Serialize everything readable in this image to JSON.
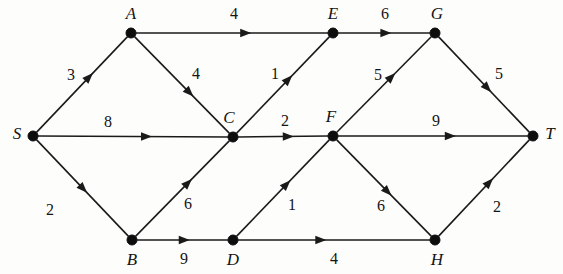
{
  "diagram": {
    "type": "directed-weighted-graph",
    "width": 563,
    "height": 274,
    "background_color": "#fdfdfb",
    "stroke_color": "#1a1a1a",
    "node_color": "#0d0d0d",
    "text_color": "#141414"
  },
  "nodes": [
    {
      "id": "S",
      "label": "S",
      "x": 33,
      "y": 136,
      "label_x": 17,
      "label_y": 134
    },
    {
      "id": "A",
      "label": "A",
      "x": 131,
      "y": 33,
      "label_x": 131,
      "label_y": 14
    },
    {
      "id": "B",
      "label": "B",
      "x": 132,
      "y": 240,
      "label_x": 132,
      "label_y": 260
    },
    {
      "id": "C",
      "label": "C",
      "x": 233,
      "y": 137,
      "label_x": 229,
      "label_y": 118
    },
    {
      "id": "D",
      "label": "D",
      "x": 233,
      "y": 240,
      "label_x": 233,
      "label_y": 260
    },
    {
      "id": "E",
      "label": "E",
      "x": 333,
      "y": 33,
      "label_x": 333,
      "label_y": 14
    },
    {
      "id": "F",
      "label": "F",
      "x": 333,
      "y": 136,
      "label_x": 331,
      "label_y": 117
    },
    {
      "id": "G",
      "label": "G",
      "x": 435,
      "y": 33,
      "label_x": 437,
      "label_y": 14
    },
    {
      "id": "H",
      "label": "H",
      "x": 435,
      "y": 240,
      "label_x": 437,
      "label_y": 260
    },
    {
      "id": "T",
      "label": "T",
      "x": 533,
      "y": 136,
      "label_x": 550,
      "label_y": 134
    }
  ],
  "edges": [
    {
      "from": "S",
      "to": "A",
      "weight": "3",
      "label_x": 71,
      "label_y": 75,
      "arrow_t": 0.62
    },
    {
      "from": "S",
      "to": "C",
      "weight": "8",
      "label_x": 108,
      "label_y": 122,
      "arrow_t": 0.6
    },
    {
      "from": "S",
      "to": "B",
      "weight": "2",
      "label_x": 50,
      "label_y": 210,
      "arrow_t": 0.55
    },
    {
      "from": "A",
      "to": "E",
      "weight": "4",
      "label_x": 234,
      "label_y": 14,
      "arrow_t": 0.6
    },
    {
      "from": "A",
      "to": "C",
      "weight": "4",
      "label_x": 196,
      "label_y": 74,
      "arrow_t": 0.62
    },
    {
      "from": "B",
      "to": "C",
      "weight": "6",
      "label_x": 188,
      "label_y": 204,
      "arrow_t": 0.6
    },
    {
      "from": "B",
      "to": "D",
      "weight": "9",
      "label_x": 184,
      "label_y": 259,
      "arrow_t": 0.58
    },
    {
      "from": "C",
      "to": "E",
      "weight": "1",
      "label_x": 275,
      "label_y": 74,
      "arrow_t": 0.6
    },
    {
      "from": "C",
      "to": "F",
      "weight": "2",
      "label_x": 285,
      "label_y": 121,
      "arrow_t": 0.62
    },
    {
      "from": "D",
      "to": "F",
      "weight": "1",
      "label_x": 292,
      "label_y": 205,
      "arrow_t": 0.58
    },
    {
      "from": "D",
      "to": "H",
      "weight": "4",
      "label_x": 334,
      "label_y": 259,
      "arrow_t": 0.46
    },
    {
      "from": "E",
      "to": "G",
      "weight": "6",
      "label_x": 385,
      "label_y": 14,
      "arrow_t": 0.58
    },
    {
      "from": "F",
      "to": "G",
      "weight": "5",
      "label_x": 378,
      "label_y": 75,
      "arrow_t": 0.62
    },
    {
      "from": "F",
      "to": "T",
      "weight": "9",
      "label_x": 436,
      "label_y": 121,
      "arrow_t": 0.62
    },
    {
      "from": "F",
      "to": "H",
      "weight": "6",
      "label_x": 381,
      "label_y": 206,
      "arrow_t": 0.58
    },
    {
      "from": "G",
      "to": "T",
      "weight": "5",
      "label_x": 499,
      "label_y": 74,
      "arrow_t": 0.58
    },
    {
      "from": "H",
      "to": "T",
      "weight": "2",
      "label_x": 497,
      "label_y": 207,
      "arrow_t": 0.6
    }
  ]
}
